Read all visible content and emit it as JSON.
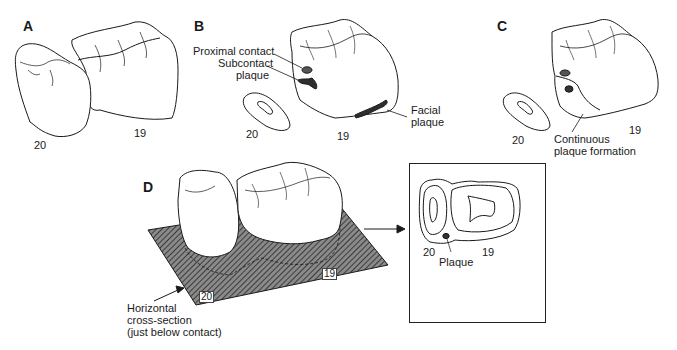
{
  "figure": {
    "panels": [
      {
        "id": "A",
        "letter": "A",
        "tooth_labels": [
          "20",
          "19"
        ]
      },
      {
        "id": "B",
        "letter": "B",
        "tooth_labels": [
          "20",
          "19"
        ],
        "annotations": [
          "Proximal contact",
          "Subcontact",
          "plaque",
          "Facial",
          "plaque"
        ]
      },
      {
        "id": "C",
        "letter": "C",
        "tooth_labels": [
          "20",
          "19"
        ],
        "annotations": [
          "Continuous",
          "plaque formation"
        ]
      },
      {
        "id": "D",
        "letter": "D",
        "tooth_labels": [
          "20",
          "19"
        ],
        "annotations": [
          "Horizontal",
          "cross-section",
          "(just below contact)"
        ]
      }
    ],
    "inset": {
      "tooth_labels": [
        "20",
        "19"
      ],
      "annotation": "Plaque"
    },
    "colors": {
      "line": "#1a1a1a",
      "plaque": "#3a3a3a",
      "hatch": "#555555",
      "background": "#ffffff"
    }
  }
}
